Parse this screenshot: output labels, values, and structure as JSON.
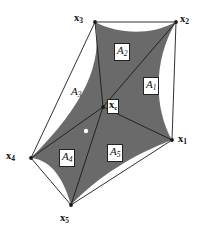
{
  "figure": {
    "width": 203,
    "height": 234,
    "background_color": "#ffffff",
    "shade_color": "#6a6a6a",
    "line_color": "#1a1a1a",
    "vertices": [
      {
        "id": "x1",
        "label": "x",
        "sub": "1",
        "x": 172,
        "y": 140,
        "label_x": 178,
        "label_y": 134
      },
      {
        "id": "x2",
        "label": "x",
        "sub": "2",
        "x": 176,
        "y": 22,
        "label_x": 180,
        "label_y": 14
      },
      {
        "id": "x3",
        "label": "x",
        "sub": "3",
        "x": 95,
        "y": 22,
        "label_x": 74,
        "label_y": 13
      },
      {
        "id": "x4",
        "label": "x",
        "sub": "4",
        "x": 31,
        "y": 158,
        "label_x": 6,
        "label_y": 151
      },
      {
        "id": "x5",
        "label": "x",
        "sub": "5",
        "x": 71,
        "y": 205,
        "label_x": 60,
        "label_y": 213
      }
    ],
    "center": {
      "id": "xc",
      "label": "x",
      "sub": "c",
      "x": 103,
      "y": 107,
      "label_x": 107,
      "label_y": 100
    },
    "interior_dot": {
      "id": "white-dot",
      "x": 86,
      "y": 131,
      "r": 2.2,
      "color": "#ffffff"
    },
    "areas": [
      {
        "id": "A1",
        "label": "A",
        "sub": "1",
        "x": 143,
        "y": 77,
        "boxed": true
      },
      {
        "id": "A2",
        "label": "A",
        "sub": "2",
        "x": 114,
        "y": 43,
        "boxed": true
      },
      {
        "id": "A3",
        "label": "A",
        "sub": "3",
        "x": 71,
        "y": 86,
        "boxed": false
      },
      {
        "id": "A4",
        "label": "A",
        "sub": "4",
        "x": 59,
        "y": 149,
        "boxed": true
      },
      {
        "id": "A5",
        "label": "A",
        "sub": "5",
        "x": 107,
        "y": 144,
        "boxed": true
      }
    ]
  }
}
